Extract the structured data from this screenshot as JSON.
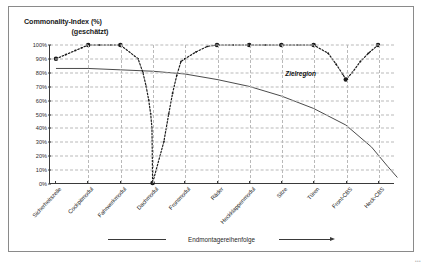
{
  "axis_title": {
    "line1": "Commonality-Index (%)",
    "line2": "(geschätzt)"
  },
  "annotation": {
    "zielregion": "Zielregion"
  },
  "legend": {
    "text": "Endmontagereihenfolge"
  },
  "corner": {
    "mark": "•••"
  },
  "chart_data": {
    "type": "line",
    "title": "Commonality-Index (%) (geschätzt)",
    "xlabel": "Endmontagereihenfolge",
    "ylabel": "Commonality-Index (%) (geschätzt)",
    "ylim": [
      0,
      100
    ],
    "xlim": [
      0,
      11
    ],
    "grid": true,
    "legend_position": "bottom",
    "ytick_labels": [
      "100%",
      "90%",
      "80%",
      "70%",
      "60%",
      "50%",
      "40%",
      "30%",
      "20%",
      "10%",
      "0%"
    ],
    "ytick_values": [
      100,
      90,
      80,
      70,
      60,
      50,
      40,
      30,
      20,
      10,
      0
    ],
    "categories": [
      "Sicherheitszelle",
      "Cockpitmodul",
      "Fahrwerkmodul",
      "Dachmodul",
      "Frontmodul",
      "Räder",
      "Heckklappenmodul",
      "Sitze",
      "Türen",
      "Front-CBS",
      "Heck-CBS"
    ],
    "series": [
      {
        "name": "Commonality-Index",
        "style": "dashed-with-markers",
        "color": "#1a1a1a",
        "values": [
          90,
          100,
          100,
          0,
          100,
          100,
          100,
          100,
          100,
          75,
          100
        ],
        "interpolated_points": [
          {
            "x": 0.0,
            "y": 90
          },
          {
            "x": 0.3,
            "y": 93
          },
          {
            "x": 0.6,
            "y": 96
          },
          {
            "x": 0.8,
            "y": 98
          },
          {
            "x": 1.0,
            "y": 100
          },
          {
            "x": 1.35,
            "y": 100
          },
          {
            "x": 1.7,
            "y": 100
          },
          {
            "x": 2.0,
            "y": 100
          },
          {
            "x": 2.55,
            "y": 90
          },
          {
            "x": 2.7,
            "y": 80
          },
          {
            "x": 2.8,
            "y": 70
          },
          {
            "x": 2.88,
            "y": 60
          },
          {
            "x": 2.94,
            "y": 50
          },
          {
            "x": 2.98,
            "y": 40
          },
          {
            "x": 3.0,
            "y": 0
          },
          {
            "x": 3.35,
            "y": 30
          },
          {
            "x": 3.5,
            "y": 50
          },
          {
            "x": 3.62,
            "y": 65
          },
          {
            "x": 3.75,
            "y": 78
          },
          {
            "x": 3.88,
            "y": 88
          },
          {
            "x": 4.0,
            "y": 90
          },
          {
            "x": 4.35,
            "y": 95
          },
          {
            "x": 4.7,
            "y": 99
          },
          {
            "x": 5.0,
            "y": 100
          },
          {
            "x": 5.5,
            "y": 100
          },
          {
            "x": 6.0,
            "y": 100
          },
          {
            "x": 6.5,
            "y": 100
          },
          {
            "x": 7.0,
            "y": 100
          },
          {
            "x": 7.5,
            "y": 100
          },
          {
            "x": 8.0,
            "y": 100
          },
          {
            "x": 8.45,
            "y": 94
          },
          {
            "x": 8.7,
            "y": 86
          },
          {
            "x": 8.9,
            "y": 79
          },
          {
            "x": 9.0,
            "y": 75
          },
          {
            "x": 9.2,
            "y": 80
          },
          {
            "x": 9.45,
            "y": 88
          },
          {
            "x": 9.7,
            "y": 94
          },
          {
            "x": 10.0,
            "y": 100
          }
        ],
        "marker_points": [
          {
            "x": 0,
            "y": 90
          },
          {
            "x": 2,
            "y": 100
          },
          {
            "x": 3,
            "y": 0
          },
          {
            "x": 5,
            "y": 100
          },
          {
            "x": 6,
            "y": 100
          },
          {
            "x": 7,
            "y": 100
          },
          {
            "x": 8,
            "y": 100
          },
          {
            "x": 9,
            "y": 75
          },
          {
            "x": 10,
            "y": 100
          },
          {
            "x": 1,
            "y": 100
          }
        ]
      },
      {
        "name": "Zielregion",
        "style": "solid",
        "color": "#4a4a4a",
        "curve_points": [
          {
            "x": 0.0,
            "y": 83
          },
          {
            "x": 1.0,
            "y": 83
          },
          {
            "x": 2.0,
            "y": 82
          },
          {
            "x": 3.0,
            "y": 81
          },
          {
            "x": 4.0,
            "y": 79
          },
          {
            "x": 5.0,
            "y": 75
          },
          {
            "x": 6.0,
            "y": 70
          },
          {
            "x": 7.0,
            "y": 63
          },
          {
            "x": 8.0,
            "y": 54
          },
          {
            "x": 9.0,
            "y": 42
          },
          {
            "x": 9.8,
            "y": 26
          },
          {
            "x": 10.3,
            "y": 12
          },
          {
            "x": 10.6,
            "y": 4
          }
        ]
      }
    ]
  }
}
